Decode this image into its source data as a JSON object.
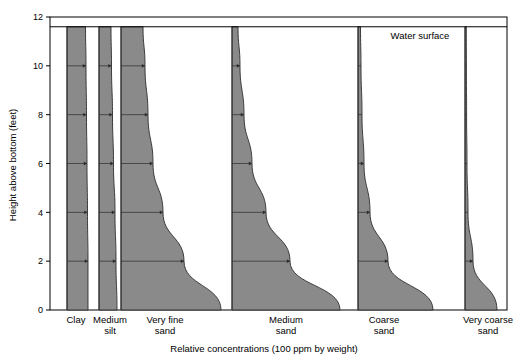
{
  "chart_data": {
    "type": "area",
    "title": "",
    "xlabel": "Relative concentrations (100 ppm by weight)",
    "ylabel": "Height above bottom (feet)",
    "ylim": [
      0,
      12
    ],
    "yticks": [
      0,
      2,
      4,
      6,
      8,
      10,
      12
    ],
    "ytick_labels": [
      "0",
      "2",
      "4",
      "6",
      "8",
      "10",
      "12"
    ],
    "grid": false,
    "legend": false,
    "annotations": [
      {
        "text": "Water surface",
        "x_px": 420,
        "y_ft": 11.1
      }
    ],
    "water_surface_ft": 11.6,
    "plot_box_px": {
      "left": 50,
      "right": 507,
      "top": 17,
      "bottom": 310
    },
    "x_axis_note": "Each sediment class has its own zero baseline; width of grey band = relative concentration",
    "categories": [
      "Clay",
      "Medium silt",
      "Very fine sand",
      "Medium sand",
      "Coarse sand",
      "Very coarse sand"
    ],
    "category_labels": [
      {
        "line1": "Clay",
        "line2": ""
      },
      {
        "line1": "Medium",
        "line2": "silt"
      },
      {
        "line1": "Very fine",
        "line2": "sand"
      },
      {
        "line1": "Medium",
        "line2": "sand"
      },
      {
        "line1": "Coarse",
        "line2": "sand"
      },
      {
        "line1": "Very coarse",
        "line2": "sand"
      }
    ],
    "heights_ft": [
      0,
      2,
      4,
      6,
      8,
      10,
      11.6
    ],
    "series": [
      {
        "name": "Clay",
        "baseline_px": 67,
        "label_center_px": 76,
        "widths_px_by_height": [
          21,
          21,
          20.5,
          20,
          19.5,
          19,
          18.5
        ],
        "concentration_note": "nearly uniform with height"
      },
      {
        "name": "Medium silt",
        "baseline_px": 99,
        "label_center_px": 110,
        "widths_px_by_height": [
          18,
          17,
          16,
          14.5,
          13.5,
          12.5,
          12
        ],
        "concentration_note": "slight decrease upward"
      },
      {
        "name": "Very fine sand",
        "baseline_px": 121,
        "label_center_px": 165,
        "widths_px_by_height": [
          100,
          63,
          42,
          32,
          27,
          24,
          22
        ],
        "concentration_note": "strong increase toward bottom"
      },
      {
        "name": "Medium sand",
        "baseline_px": 232,
        "label_center_px": 286,
        "widths_px_by_height": [
          108,
          58,
          34,
          20,
          12,
          8,
          6
        ],
        "concentration_note": "steep exponential increase toward bottom"
      },
      {
        "name": "Coarse sand",
        "baseline_px": 358,
        "label_center_px": 384,
        "widths_px_by_height": [
          75,
          30,
          12,
          6,
          4,
          3,
          2.5
        ],
        "concentration_note": "very steep; negligible above 4 ft"
      },
      {
        "name": "Very coarse sand",
        "baseline_px": 465,
        "label_center_px": 488,
        "widths_px_by_height": [
          32,
          8,
          3,
          2,
          1.6,
          1.4,
          1.3
        ],
        "concentration_note": "confined to lowest 2 ft"
      }
    ],
    "colors": {
      "fill": "#8a8a8a",
      "outline": "#2b2b2b",
      "axis": "#000000",
      "background": "#ffffff",
      "tick_line": "#555555"
    }
  }
}
